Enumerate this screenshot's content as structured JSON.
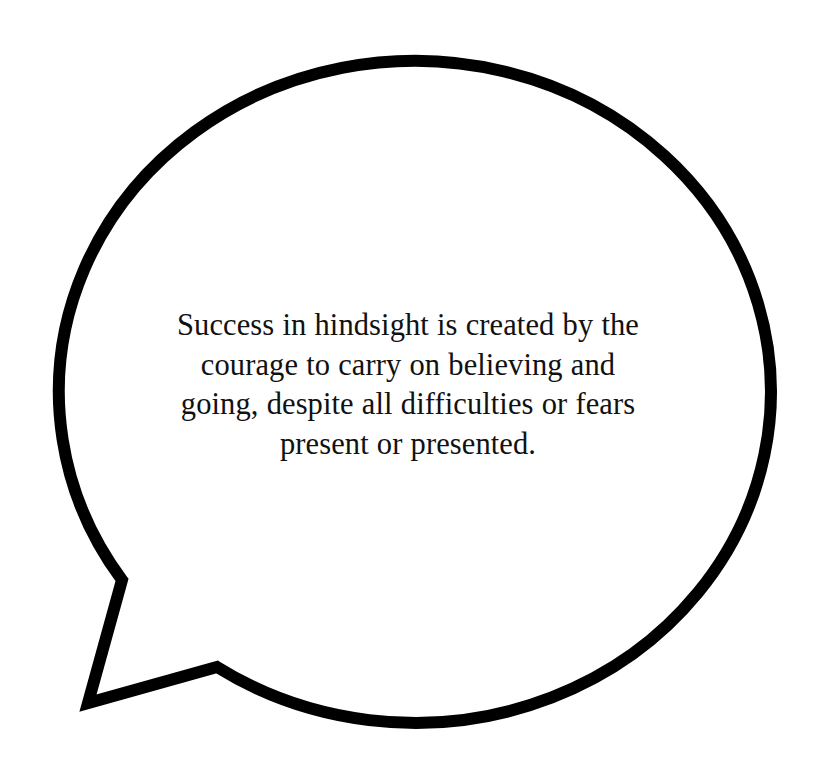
{
  "canvas": {
    "width": 816,
    "height": 775,
    "background_color": "#ffffff"
  },
  "bubble": {
    "shape": "speech-balloon",
    "outline_color": "#000000",
    "fill_color": "#ffffff",
    "stroke_width": 12,
    "ellipse": {
      "center_x": 410,
      "center_y": 390,
      "radius_x": 356,
      "radius_y": 331
    },
    "tail": {
      "notch_x": 122,
      "notch_y": 580,
      "tip_x": 88,
      "tip_y": 703,
      "elbow_x": 217,
      "elbow_y": 667
    }
  },
  "quote": {
    "full_text": "Success in hindsight is created by the courage to carry on believing and going, despite all difficulties or fears present or presented.",
    "alignment": "center",
    "text_color": "#111111",
    "lines": [
      "Success in hindsight is created by the",
      "courage to carry on believing and",
      "going, despite all difficulties or fears",
      "present or presented."
    ]
  }
}
